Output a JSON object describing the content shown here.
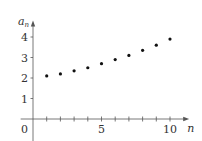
{
  "chart_data": {
    "type": "scatter",
    "title": "",
    "xlabel": "n",
    "ylabel": "a_n",
    "ylabel_main": "a",
    "ylabel_sub": "n",
    "x": [
      1,
      2,
      3,
      4,
      5,
      6,
      7,
      8,
      9,
      10
    ],
    "series": [
      {
        "name": "a_n",
        "values": [
          2.1,
          2.2,
          2.35,
          2.5,
          2.7,
          2.9,
          3.1,
          3.35,
          3.6,
          3.9
        ]
      }
    ],
    "xlim": [
      -0.9,
      11.4
    ],
    "ylim": [
      -1.3,
      4.8
    ],
    "x_ticks": [
      1,
      2,
      3,
      4,
      5,
      6,
      7,
      8,
      9,
      10
    ],
    "x_tick_labels": [
      {
        "value": 5,
        "label": "5"
      },
      {
        "value": 10,
        "label": "10"
      }
    ],
    "y_ticks": [
      1,
      2,
      3,
      4
    ],
    "y_tick_labels": [
      {
        "value": 1,
        "label": "1"
      },
      {
        "value": 2,
        "label": "2"
      },
      {
        "value": 3,
        "label": "3"
      },
      {
        "value": 4,
        "label": "4"
      }
    ],
    "origin_label": "0",
    "grid": false,
    "legend": null,
    "colors": {
      "points": "#111111",
      "axes": "#555555",
      "text": "#333333"
    }
  }
}
